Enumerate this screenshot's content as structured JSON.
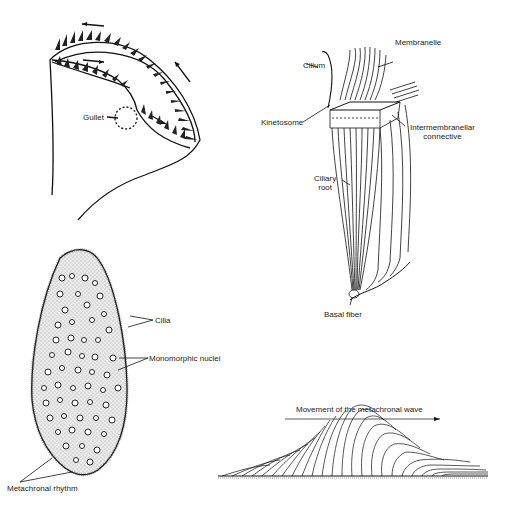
{
  "figure": {
    "panels": [
      {
        "id": "oral-apparatus",
        "labels": {
          "gullet": "Gullet"
        }
      },
      {
        "id": "membranelle-structure",
        "labels": {
          "cilium": "Cilium",
          "membranelle": "Membranelle",
          "kinetosome": "Kinetosome",
          "intermembranellar_1": "Intermembranellar",
          "intermembranellar_2": "connective",
          "ciliary_root_1": "Ciliary",
          "ciliary_root_2": "root",
          "basal_fiber": "Basal fiber"
        }
      },
      {
        "id": "ciliate-cell",
        "labels": {
          "cilia": "Cilia",
          "nuclei": "Monomorphic nuclei",
          "metachronal_rhythm": "Metachronal rhythm"
        }
      },
      {
        "id": "metachronal-wave",
        "labels": {
          "movement": "Movement of the metachronal wave"
        }
      }
    ]
  }
}
